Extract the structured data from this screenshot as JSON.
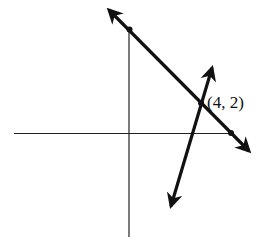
{
  "diagram": {
    "type": "coordinate-plane",
    "axes": {
      "x_axis": true,
      "y_axis": true
    },
    "lines": [
      {
        "name": "line-1",
        "direction": "negative-slope",
        "marked_points": [
          "y-intercept",
          "x-intercept"
        ]
      },
      {
        "name": "line-2",
        "direction": "positive-slope"
      }
    ],
    "intersection": {
      "label": "(4, 2)",
      "x": 4,
      "y": 2
    },
    "color": "#111111"
  }
}
